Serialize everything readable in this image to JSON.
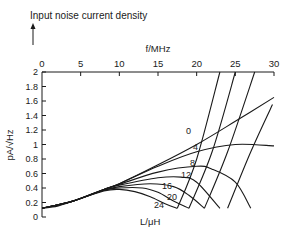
{
  "chart_data": {
    "type": "line",
    "title": "Input noise current density",
    "xlabel": "f/MHz",
    "ylabel": "pA/√Hz",
    "legend_title": "L/μH",
    "xlim": [
      0,
      30
    ],
    "ylim": [
      0,
      2
    ],
    "x_ticks": [
      "0",
      "5",
      "10",
      "15",
      "20",
      "25",
      "30"
    ],
    "y_ticks": [
      "0",
      "0.2",
      "0.4",
      "0.6",
      "0.8",
      "1",
      "1.2",
      "1.4",
      "1.6",
      "1.8",
      "2"
    ],
    "x_axis_position": "top",
    "grid": false,
    "series": [
      {
        "name": "0",
        "x": [
          0,
          2,
          4,
          6,
          8,
          10,
          15,
          20,
          25,
          30
        ],
        "y": [
          0.12,
          0.15,
          0.22,
          0.3,
          0.38,
          0.46,
          0.72,
          1.0,
          1.32,
          1.65
        ]
      },
      {
        "name": "4",
        "x": [
          0,
          4,
          8,
          10,
          15,
          20,
          25,
          30
        ],
        "y": [
          0.12,
          0.22,
          0.38,
          0.46,
          0.7,
          0.9,
          1.0,
          0.98
        ]
      },
      {
        "name": "8",
        "x": [
          0,
          4,
          8,
          10,
          15,
          20,
          22,
          25,
          27
        ],
        "y": [
          0.12,
          0.22,
          0.38,
          0.45,
          0.62,
          0.7,
          0.66,
          0.48,
          0.12
        ]
      },
      {
        "name": "12",
        "x": [
          0,
          4,
          8,
          10,
          15,
          18,
          20,
          23
        ],
        "y": [
          0.12,
          0.22,
          0.38,
          0.44,
          0.54,
          0.55,
          0.48,
          0.12
        ]
      },
      {
        "name": "16",
        "x": [
          0,
          4,
          8,
          10,
          14,
          17,
          19,
          21
        ],
        "y": [
          0.12,
          0.22,
          0.37,
          0.42,
          0.46,
          0.42,
          0.3,
          0.12
        ]
      },
      {
        "name": "20",
        "x": [
          0,
          4,
          8,
          10,
          13,
          15,
          17,
          19
        ],
        "y": [
          0.12,
          0.22,
          0.37,
          0.4,
          0.4,
          0.34,
          0.22,
          0.12
        ]
      },
      {
        "name": "24",
        "x": [
          0,
          4,
          8,
          10,
          12,
          14,
          16,
          17.5
        ],
        "y": [
          0.12,
          0.22,
          0.36,
          0.38,
          0.35,
          0.28,
          0.18,
          0.12
        ]
      }
    ],
    "resonance_branches": [
      {
        "x": [
          17.5,
          20,
          23
        ],
        "y": [
          0.12,
          0.8,
          2.0
        ]
      },
      {
        "x": [
          19,
          22,
          25
        ],
        "y": [
          0.12,
          0.9,
          2.0
        ]
      },
      {
        "x": [
          21,
          24,
          27.5
        ],
        "y": [
          0.12,
          0.9,
          2.0
        ]
      },
      {
        "x": [
          24,
          27,
          29.8
        ],
        "y": [
          0.12,
          0.9,
          1.55
        ]
      }
    ]
  },
  "labels": {
    "title": "Input noise current density",
    "xlabel": "f/MHz",
    "ylabel": "pA/√Hz",
    "legend_title": "L/μH",
    "curve_labels": [
      "0",
      "4",
      "8",
      "12",
      "16",
      "20",
      "24"
    ]
  }
}
